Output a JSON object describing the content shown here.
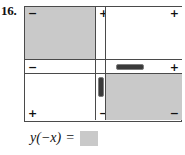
{
  "problem": {
    "number": "16."
  },
  "colors": {
    "shaded_cell": "#c9c9c9",
    "unshaded_cell": "#ffffff",
    "border": "#4a4a4a",
    "thumb": "#3a3a3a",
    "answer_box": "#c9c9c9",
    "text": "#111111"
  },
  "grid": {
    "name": "sign-chart",
    "columns": 2,
    "rows": 2,
    "cells": [
      {
        "id": "top-left",
        "shaded": true,
        "signs": [
          {
            "position": "top-left",
            "symbol": "−"
          }
        ]
      },
      {
        "id": "top-right",
        "shaded": false,
        "signs": [
          {
            "position": "top-right",
            "symbol": "+"
          }
        ]
      },
      {
        "id": "bottom-left",
        "shaded": false,
        "signs": [
          {
            "position": "bottom-left",
            "symbol": "+"
          }
        ]
      },
      {
        "id": "bottom-right",
        "shaded": true,
        "signs": [
          {
            "position": "bottom-right",
            "symbol": "−"
          }
        ]
      }
    ],
    "vertical_strip": {
      "name": "vertical-slider-strip",
      "top_sign": "+",
      "bottom_sign": "−",
      "thumb": "vertical-slider-thumb"
    },
    "horizontal_strip": {
      "name": "horizontal-slider-strip",
      "left_sign": "−",
      "right_sign": "+",
      "thumb": "horizontal-slider-thumb"
    }
  },
  "answer": {
    "expression": "y(−x)",
    "equals": "=",
    "value": ""
  }
}
